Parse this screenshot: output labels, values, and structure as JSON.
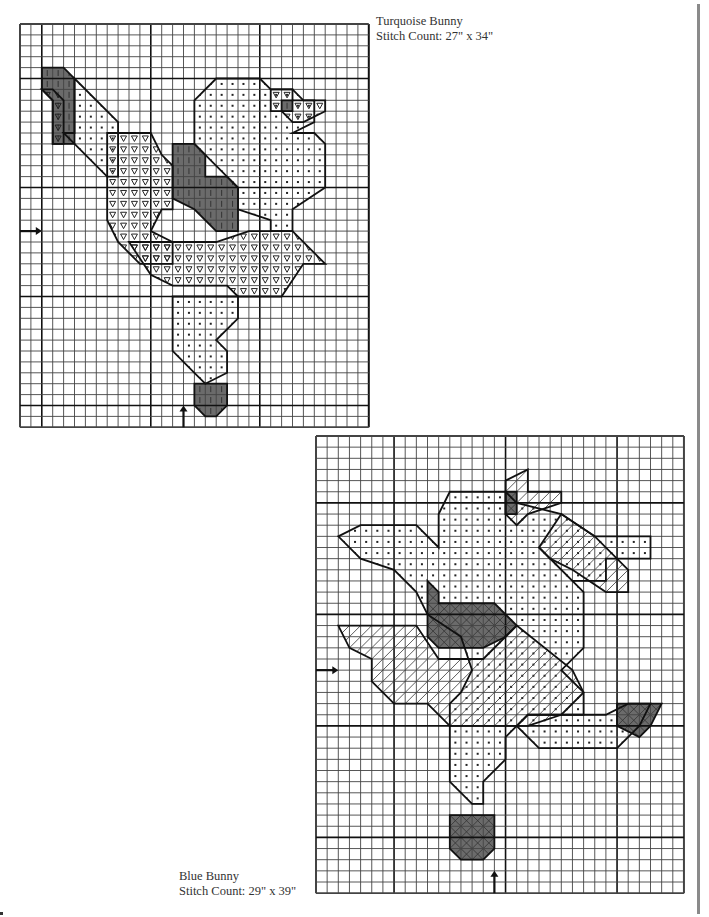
{
  "page": {
    "background": "#ffffff",
    "rule_color": "#8a8a8a"
  },
  "charts": [
    {
      "id": "turquoise-bunny",
      "caption": {
        "title": "Turquoise Bunny",
        "stitch_count": "Stitch Count: 27\" x 34\""
      },
      "box": {
        "left": 20,
        "top": 24,
        "cols": 32,
        "rows": 37,
        "cell": 10.9
      },
      "major_every": 10,
      "major_offset": {
        "x": 2,
        "y": 5
      },
      "arrows": [
        {
          "dir": "right",
          "row": 19,
          "label": "center-row-arrow"
        },
        {
          "dir": "up",
          "col": 15,
          "label": "center-col-arrow"
        }
      ],
      "fills": [
        {
          "pattern": "dark",
          "poly": [
            [
              2,
              4
            ],
            [
              4,
              4
            ],
            [
              5,
              5
            ],
            [
              5,
              11
            ],
            [
              3,
              11
            ],
            [
              3,
              7
            ],
            [
              2,
              6
            ]
          ]
        },
        {
          "pattern": "tri",
          "poly": [
            [
              2,
              6
            ],
            [
              3,
              7
            ],
            [
              3,
              11
            ],
            [
              4,
              11
            ],
            [
              4,
              7
            ],
            [
              3,
              6
            ]
          ]
        },
        {
          "pattern": "dot",
          "poly": [
            [
              5,
              5
            ],
            [
              9,
              9
            ],
            [
              9,
              14
            ],
            [
              8,
              14
            ],
            [
              4,
              10
            ],
            [
              5,
              10
            ]
          ]
        },
        {
          "pattern": "tri",
          "poly": [
            [
              8,
              10
            ],
            [
              12,
              10
            ],
            [
              13,
              12
            ],
            [
              14,
              13
            ],
            [
              14,
              17
            ],
            [
              13,
              17
            ],
            [
              12,
              19
            ],
            [
              14,
              20
            ],
            [
              14,
              22
            ],
            [
              11,
              22
            ],
            [
              9,
              20
            ],
            [
              8,
              18
            ],
            [
              8,
              14
            ]
          ]
        },
        {
          "pattern": "tri",
          "poly": [
            [
              10,
              20
            ],
            [
              18,
              20
            ],
            [
              21,
              19
            ],
            [
              25,
              19
            ],
            [
              28,
              22
            ],
            [
              26,
              22
            ],
            [
              24,
              25
            ],
            [
              20,
              25
            ],
            [
              19,
              24
            ],
            [
              14,
              24
            ],
            [
              12,
              23
            ]
          ]
        },
        {
          "pattern": "dark",
          "poly": [
            [
              14,
              11
            ],
            [
              16,
              11
            ],
            [
              17,
              12
            ],
            [
              17,
              14
            ],
            [
              19,
              14
            ],
            [
              20,
              15
            ],
            [
              20,
              19
            ],
            [
              18,
              19
            ],
            [
              16,
              17
            ],
            [
              14,
              16
            ]
          ]
        },
        {
          "pattern": "dot",
          "poly": [
            [
              16,
              7
            ],
            [
              18,
              5
            ],
            [
              22,
              5
            ],
            [
              23,
              6
            ],
            [
              25,
              6
            ],
            [
              26,
              7
            ],
            [
              27,
              7
            ],
            [
              27,
              9
            ],
            [
              25,
              10
            ],
            [
              27,
              10
            ],
            [
              28,
              11
            ],
            [
              28,
              15
            ],
            [
              25,
              17
            ],
            [
              25,
              19
            ],
            [
              23,
              19
            ],
            [
              23,
              18
            ],
            [
              20,
              17
            ],
            [
              20,
              15
            ],
            [
              17,
              12
            ],
            [
              16,
              11
            ]
          ]
        },
        {
          "pattern": "tri",
          "poly": [
            [
              23,
              6
            ],
            [
              25,
              6
            ],
            [
              25,
              7
            ],
            [
              28,
              7
            ],
            [
              28,
              8
            ],
            [
              26,
              9
            ],
            [
              25,
              9
            ],
            [
              24,
              8
            ],
            [
              23,
              8
            ]
          ]
        },
        {
          "pattern": "dark",
          "poly": [
            [
              24,
              7
            ],
            [
              25,
              7
            ],
            [
              25,
              8
            ],
            [
              24,
              8
            ]
          ]
        },
        {
          "pattern": "dot",
          "poly": [
            [
              14,
              25
            ],
            [
              20,
              25
            ],
            [
              20,
              27
            ],
            [
              18,
              29
            ],
            [
              19,
              30
            ],
            [
              19,
              32
            ],
            [
              17,
              33
            ],
            [
              16,
              32
            ],
            [
              14,
              30
            ]
          ]
        },
        {
          "pattern": "dark",
          "poly": [
            [
              16,
              33
            ],
            [
              19,
              33
            ],
            [
              19,
              35
            ],
            [
              18,
              36
            ],
            [
              17,
              36
            ],
            [
              16,
              35
            ]
          ]
        }
      ]
    },
    {
      "id": "blue-bunny",
      "caption": {
        "title": "Blue Bunny",
        "stitch_count": "Stitch Count: 29\" x 39\""
      },
      "box": {
        "left": 316,
        "top": 436,
        "cols": 33,
        "rows": 41,
        "cell": 11.15
      },
      "major_every": 10,
      "major_offset": {
        "x": 7,
        "y": 6
      },
      "arrows": [
        {
          "dir": "right",
          "row": 21,
          "label": "center-row-arrow"
        },
        {
          "dir": "up",
          "col": 16,
          "label": "center-col-arrow"
        }
      ],
      "fills": [
        {
          "pattern": "dot",
          "poly": [
            [
              2,
              9
            ],
            [
              4,
              8
            ],
            [
              9,
              8
            ],
            [
              11,
              10
            ],
            [
              11,
              7
            ],
            [
              12,
              5
            ],
            [
              17,
              5
            ],
            [
              18,
              6
            ],
            [
              22,
              7
            ],
            [
              25,
              9
            ],
            [
              30,
              9
            ],
            [
              30,
              11
            ],
            [
              26,
              11
            ],
            [
              26,
              13
            ],
            [
              23,
              13
            ],
            [
              20,
              10
            ],
            [
              24,
              14
            ],
            [
              24,
              19
            ],
            [
              22,
              21
            ],
            [
              24,
              23
            ],
            [
              24,
              25
            ],
            [
              19,
              25
            ],
            [
              17,
              27
            ],
            [
              17,
              29
            ],
            [
              15,
              31
            ],
            [
              15,
              33
            ],
            [
              14,
              33
            ],
            [
              12,
              31
            ],
            [
              12,
              24
            ],
            [
              13,
              23
            ],
            [
              14,
              21
            ],
            [
              13,
              18
            ],
            [
              10,
              16
            ],
            [
              9,
              14
            ],
            [
              7,
              12
            ],
            [
              4,
              11
            ]
          ]
        },
        {
          "pattern": "diag",
          "poly": [
            [
              17,
              4
            ],
            [
              19,
              3
            ],
            [
              19,
              5
            ],
            [
              22,
              5
            ],
            [
              22,
              6
            ],
            [
              19,
              7
            ],
            [
              18,
              8
            ],
            [
              17,
              7
            ]
          ]
        },
        {
          "pattern": "darkx",
          "poly": [
            [
              17,
              5
            ],
            [
              18,
              5
            ],
            [
              18,
              7
            ],
            [
              17,
              7
            ]
          ]
        },
        {
          "pattern": "diag",
          "poly": [
            [
              22,
              7
            ],
            [
              25,
              9
            ],
            [
              28,
              12
            ],
            [
              28,
              14
            ],
            [
              26,
              14
            ],
            [
              23,
              12
            ],
            [
              21,
              11
            ],
            [
              20,
              10
            ]
          ]
        },
        {
          "pattern": "diag",
          "poly": [
            [
              2,
              17
            ],
            [
              9,
              17
            ],
            [
              11,
              20
            ],
            [
              15,
              20
            ],
            [
              18,
              17
            ],
            [
              23,
              21
            ],
            [
              24,
              23
            ],
            [
              22,
              25
            ],
            [
              19,
              26
            ],
            [
              12,
              26
            ],
            [
              10,
              24
            ],
            [
              7,
              24
            ],
            [
              5,
              22
            ],
            [
              5,
              20
            ],
            [
              3,
              19
            ]
          ]
        },
        {
          "pattern": "darkx",
          "poly": [
            [
              10,
              13
            ],
            [
              11,
              14
            ],
            [
              11,
              15
            ],
            [
              13,
              15
            ],
            [
              16,
              15
            ],
            [
              18,
              17
            ],
            [
              17,
              18
            ],
            [
              15,
              19
            ],
            [
              11,
              19
            ],
            [
              10,
              18
            ]
          ]
        },
        {
          "pattern": "dot",
          "poly": [
            [
              19,
              25
            ],
            [
              26,
              25
            ],
            [
              28,
              24
            ],
            [
              30,
              24
            ],
            [
              29,
              26
            ],
            [
              27,
              28
            ],
            [
              20,
              28
            ],
            [
              18,
              26
            ]
          ]
        },
        {
          "pattern": "darkx",
          "poly": [
            [
              27,
              24
            ],
            [
              31,
              24
            ],
            [
              30,
              26
            ],
            [
              29,
              27
            ],
            [
              27,
              26
            ]
          ]
        },
        {
          "pattern": "darkx",
          "poly": [
            [
              12,
              34
            ],
            [
              16,
              34
            ],
            [
              16,
              37
            ],
            [
              15,
              38
            ],
            [
              13,
              38
            ],
            [
              12,
              37
            ]
          ]
        }
      ]
    }
  ]
}
